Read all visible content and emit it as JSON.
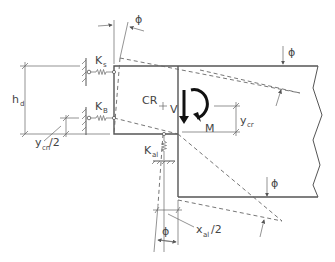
{
  "diagram": {
    "labels": {
      "phi_top_left": "ϕ",
      "phi_top_right": "ϕ",
      "phi_bottom_right": "ϕ",
      "phi_bottom": "ϕ",
      "k_s": "K",
      "k_s_sub": "s",
      "k_b": "K",
      "k_b_sub": "B",
      "k_al": "K",
      "k_al_sub": "al",
      "h_d": "h",
      "h_d_sub": "d",
      "cr": "CR",
      "v": "V",
      "m": "M",
      "y_cr": "y",
      "y_cr_sub": "cr",
      "y_cn_half": "y",
      "y_cn_half_sub": "cn",
      "y_cn_half_suffix": "/2",
      "x_al_half": "x",
      "x_al_half_sub": "al",
      "x_al_half_suffix": "/2"
    },
    "colors": {
      "line": "#555555",
      "arrow": "#111111",
      "text": "#444444"
    }
  }
}
